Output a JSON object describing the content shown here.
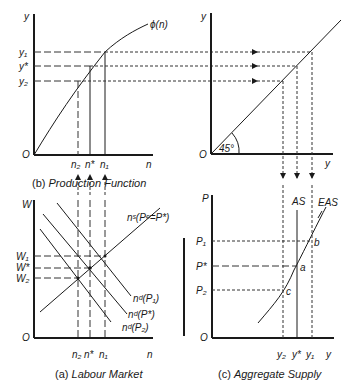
{
  "panels": {
    "production": {
      "caption_prefix": "(b)",
      "caption": "Production Function",
      "y_axis": "y",
      "x_axis": "n",
      "origin": "O",
      "curve_label": "ϕ(n)",
      "y_ticks": [
        "y₁",
        "y*",
        "y₂"
      ],
      "x_ticks": [
        "n₂",
        "n*",
        "n₁"
      ]
    },
    "reflection": {
      "y_axis": "y",
      "x_axis": "y",
      "origin": "O",
      "angle_label": "45°"
    },
    "labour": {
      "caption_prefix": "(a)",
      "caption": "Labour Market",
      "y_axis": "W",
      "x_axis": "n",
      "origin": "O",
      "supply_label": "nˢ(Pᵉ=P*)",
      "demand_labels": [
        "nᵈ(P₁)",
        "nᵈ(P*)",
        "nᵈ(P₂)"
      ],
      "y_ticks": [
        "W₁",
        "W*",
        "W₂"
      ],
      "x_ticks": [
        "n₂",
        "n*",
        "n₁"
      ]
    },
    "aggregate": {
      "caption_prefix": "(c)",
      "caption": "Aggregate Supply",
      "y_axis": "P",
      "x_axis": "y",
      "origin": "O",
      "as_label": "AS",
      "eas_label": "EAS",
      "points": [
        "b",
        "a",
        "c"
      ],
      "y_ticks": [
        "P₁",
        "P*",
        "P₂"
      ],
      "x_ticks": [
        "y₂",
        "y*",
        "y₁"
      ]
    }
  }
}
